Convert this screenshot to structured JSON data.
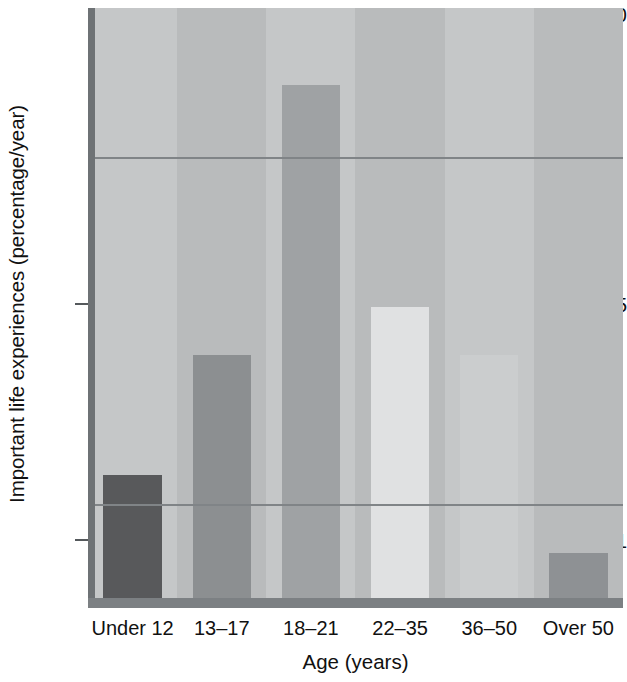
{
  "chart_data": {
    "type": "bar",
    "title": "",
    "xlabel": "Age (years)",
    "ylabel": "Important life experiences (percentage/year)",
    "yscale": "log",
    "ylim": [
      0.62,
      10
    ],
    "ytick_labels": [
      "10",
      "5",
      "1"
    ],
    "ytick_values": [
      10,
      5,
      1
    ],
    "gridlines": [
      5,
      1
    ],
    "grid": true,
    "legend": "none",
    "categories": [
      "Under 12",
      "13–17",
      "18–21",
      "22–35",
      "36–50",
      "Over 50"
    ],
    "values": [
      1.15,
      2.0,
      7.0,
      2.5,
      2.0,
      0.8
    ],
    "bar_colors": [
      "#58595b",
      "#8c8f91",
      "#9fa2a4",
      "#e0e1e2",
      "#cbcdce",
      "#8e9194"
    ],
    "plot_background": "#b9bbbc",
    "band_color": "#c5c7c8",
    "gridline_color": "#808487",
    "axis_color": "#6e7275",
    "text_color": "#111111"
  },
  "ticks": {
    "y10": "10",
    "y5": "5",
    "y1": "1"
  },
  "axes": {
    "x_title": "Age (years)",
    "y_title": "Important life experiences (percentage/year)"
  }
}
